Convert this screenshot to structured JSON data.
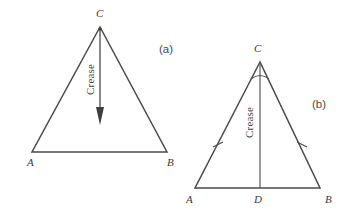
{
  "figure": {
    "background_color": "#ffffff",
    "line_color": "#4a4a4a",
    "panels": [
      {
        "id": "a",
        "caption": "(a)",
        "caption_pos": {
          "x": 166,
          "y": 53
        },
        "shape": "triangle",
        "vertices": [
          {
            "name": "C",
            "label": "C",
            "x": 100,
            "y": 27,
            "label_x": 96,
            "label_y": 17
          },
          {
            "name": "A",
            "label": "A",
            "x": 32,
            "y": 152,
            "label_x": 27,
            "label_y": 165
          },
          {
            "name": "B",
            "label": "B",
            "x": 167,
            "y": 152,
            "label_x": 168,
            "label_y": 165
          }
        ],
        "crease": {
          "label": "Crease",
          "label_x": 94,
          "label_y": 92,
          "rotation_deg": -90,
          "arrow_from": {
            "x": 100,
            "y": 30
          },
          "arrow_to": {
            "x": 100,
            "y": 124
          },
          "arrow_head": "solid-triangle"
        },
        "markings": []
      },
      {
        "id": "b",
        "caption": "(b)",
        "caption_pos": {
          "x": 312,
          "y": 108
        },
        "shape": "triangle",
        "vertices": [
          {
            "name": "C",
            "label": "C",
            "x": 260,
            "y": 62,
            "label_x": 254,
            "label_y": 52
          },
          {
            "name": "A",
            "label": "A",
            "x": 195,
            "y": 188,
            "label_x": 187,
            "label_y": 202
          },
          {
            "name": "B",
            "label": "B",
            "x": 320,
            "y": 188,
            "label_x": 325,
            "label_y": 202
          },
          {
            "name": "D",
            "label": "D",
            "x": 260,
            "y": 188,
            "label_x": 255,
            "label_y": 202
          }
        ],
        "crease": {
          "label": "Crease",
          "label_x": 254,
          "label_y": 133,
          "rotation_deg": -90,
          "line_from": {
            "x": 260,
            "y": 62
          },
          "line_to": {
            "x": 260,
            "y": 188
          }
        },
        "markings": [
          {
            "type": "angle-arc",
            "at_vertex": "C",
            "count": 1,
            "radius": 17
          },
          {
            "type": "side-tick",
            "on_side": "AC",
            "count": 1,
            "x": 218,
            "y": 145
          },
          {
            "type": "side-tick",
            "on_side": "BC",
            "count": 1,
            "x": 302,
            "y": 145
          }
        ]
      }
    ]
  }
}
